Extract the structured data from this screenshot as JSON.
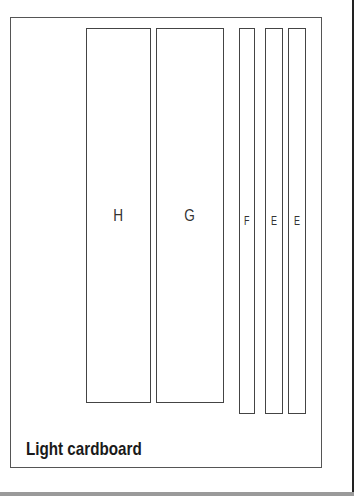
{
  "diagram": {
    "title": "Light cardboard",
    "pieces": [
      {
        "label": "H",
        "x": 86,
        "y": 28,
        "w": 65,
        "h": 375,
        "kind": "big"
      },
      {
        "label": "G",
        "x": 156,
        "y": 28,
        "w": 68,
        "h": 375,
        "kind": "big"
      },
      {
        "label": "F",
        "x": 239,
        "y": 28,
        "w": 16,
        "h": 386,
        "kind": "thin"
      },
      {
        "label": "E",
        "x": 265,
        "y": 28,
        "w": 18,
        "h": 386,
        "kind": "thin"
      },
      {
        "label": "E",
        "x": 288,
        "y": 28,
        "w": 18,
        "h": 386,
        "kind": "thin"
      }
    ]
  }
}
